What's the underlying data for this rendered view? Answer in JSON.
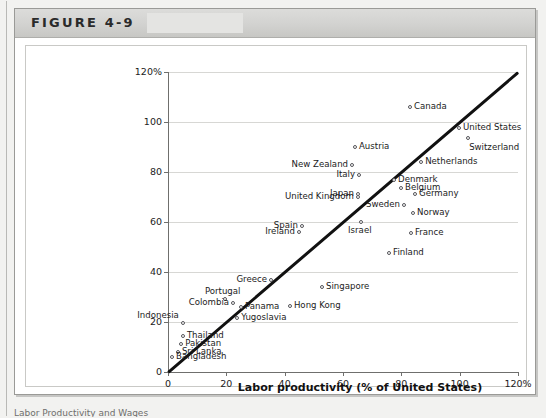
{
  "figure": {
    "label": "FIGURE 4-9",
    "caption_partial": "Labor Productivity and Wages"
  },
  "chart_data": {
    "type": "scatter",
    "title": "",
    "xlabel": "Labor productivity (% of United States)",
    "ylabel": "Relative wage (% of United States)",
    "xlim": [
      0,
      120
    ],
    "ylim": [
      0,
      120
    ],
    "xticks": [
      "0",
      "20",
      "40",
      "60",
      "80",
      "100",
      "120%"
    ],
    "xtick_values": [
      0,
      20,
      40,
      60,
      80,
      100,
      120
    ],
    "yticks": [
      "0",
      "20",
      "40",
      "60",
      "80",
      "100",
      "120%"
    ],
    "ytick_values": [
      0,
      20,
      40,
      60,
      80,
      100,
      120
    ],
    "grid": "horizontal",
    "legend": "none",
    "reference_line": {
      "name": "45-degree line",
      "from": [
        0,
        0
      ],
      "to": [
        120,
        120
      ]
    },
    "points": [
      {
        "label": "Canada",
        "x": 83.0,
        "y": 106.0,
        "label_pos": "right"
      },
      {
        "label": "United States",
        "x": 99.8,
        "y": 97.6,
        "label_pos": "right"
      },
      {
        "label": "Switzerland",
        "x": 102.9,
        "y": 93.6,
        "label_pos": "below-right"
      },
      {
        "label": "Austria",
        "x": 64.1,
        "y": 90.0,
        "label_pos": "right"
      },
      {
        "label": "New Zealand",
        "x": 63.1,
        "y": 82.8,
        "label_pos": "left"
      },
      {
        "label": "Netherlands",
        "x": 86.8,
        "y": 84.0,
        "label_pos": "right"
      },
      {
        "label": "Italy",
        "x": 65.5,
        "y": 78.8,
        "label_pos": "left"
      },
      {
        "label": "Denmark",
        "x": 77.5,
        "y": 76.8,
        "label_pos": "right"
      },
      {
        "label": "Belgium",
        "x": 79.9,
        "y": 73.6,
        "label_pos": "right"
      },
      {
        "label": "Germany",
        "x": 84.7,
        "y": 71.2,
        "label_pos": "right"
      },
      {
        "label": "Japan",
        "x": 65.1,
        "y": 71.2,
        "label_pos": "left"
      },
      {
        "label": "United Kingdom",
        "x": 65.1,
        "y": 70.0,
        "label_pos": "left"
      },
      {
        "label": "Sweden",
        "x": 80.9,
        "y": 66.8,
        "label_pos": "left"
      },
      {
        "label": "Norway",
        "x": 84.0,
        "y": 63.6,
        "label_pos": "right"
      },
      {
        "label": "Israel",
        "x": 66.2,
        "y": 60.0,
        "label_pos": "below"
      },
      {
        "label": "Spain",
        "x": 45.9,
        "y": 58.4,
        "label_pos": "left"
      },
      {
        "label": "Ireland",
        "x": 44.9,
        "y": 56.0,
        "label_pos": "left"
      },
      {
        "label": "France",
        "x": 83.3,
        "y": 55.6,
        "label_pos": "right"
      },
      {
        "label": "Finland",
        "x": 75.8,
        "y": 47.6,
        "label_pos": "right"
      },
      {
        "label": "Greece",
        "x": 35.3,
        "y": 36.8,
        "label_pos": "left"
      },
      {
        "label": "Singapore",
        "x": 52.8,
        "y": 34.0,
        "label_pos": "right"
      },
      {
        "label": "Portugal",
        "x": 19.5,
        "y": 29.2,
        "label_pos": "above"
      },
      {
        "label": "Colombia",
        "x": 22.3,
        "y": 27.6,
        "label_pos": "left"
      },
      {
        "label": "Panama",
        "x": 25.0,
        "y": 26.0,
        "label_pos": "right"
      },
      {
        "label": "Hong Kong",
        "x": 41.8,
        "y": 26.4,
        "label_pos": "right"
      },
      {
        "label": "Yugoslavia",
        "x": 23.7,
        "y": 21.6,
        "label_pos": "right"
      },
      {
        "label": "Indonesia",
        "x": 5.1,
        "y": 19.6,
        "label_pos": "above-left"
      },
      {
        "label": "Thailand",
        "x": 5.1,
        "y": 14.4,
        "label_pos": "right"
      },
      {
        "label": "Pakistan",
        "x": 4.5,
        "y": 11.2,
        "label_pos": "right"
      },
      {
        "label": "Sri Lanka",
        "x": 3.4,
        "y": 8.0,
        "label_pos": "right"
      },
      {
        "label": "Bangladesh",
        "x": 1.4,
        "y": 6.0,
        "label_pos": "right"
      }
    ]
  }
}
